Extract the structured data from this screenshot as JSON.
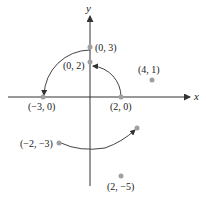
{
  "axes": {
    "x_label": "x",
    "y_label": "y"
  },
  "colors": {
    "axis": "#333333",
    "curve": "#444444",
    "point": "#a0a0a0",
    "text": "#222222"
  },
  "points": [
    {
      "id": "p-0-3",
      "label": "(0, 3)"
    },
    {
      "id": "p-0-2",
      "label": "(0, 2)"
    },
    {
      "id": "p-4-1",
      "label": "(4, 1)"
    },
    {
      "id": "p-neg3-0",
      "label": "(−3, 0)"
    },
    {
      "id": "p-2-0",
      "label": "(2, 0)"
    },
    {
      "id": "p-neg2-neg3",
      "label": "(−2, −3)"
    },
    {
      "id": "p-2-neg5",
      "label": "(2, −5)"
    }
  ],
  "arrows": [
    {
      "from": "(0, 3)",
      "to": "(−3, 0)"
    },
    {
      "from": "(2, 0)",
      "to": "(0, 2)"
    },
    {
      "from": "(−2, −3)",
      "to": "(3, −2)"
    }
  ]
}
